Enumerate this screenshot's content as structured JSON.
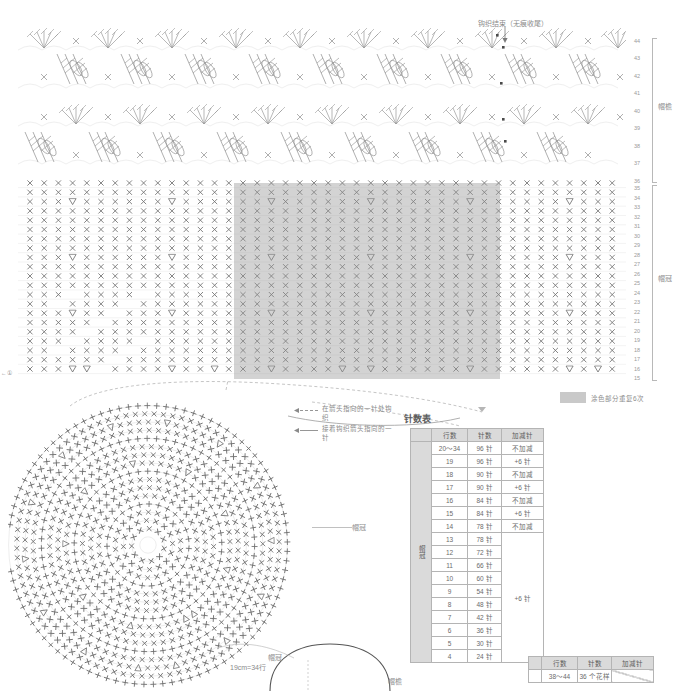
{
  "top_title": "",
  "annotations": {
    "finish": "钩织结束（无痕收尾）",
    "note_dashed": "在箭头指向的一针处钩织",
    "note_solid": "接着钩织箭头指向的一针",
    "legend_text": "涂色部分重复6次",
    "brim_label": "帽檐",
    "crown_label": "帽冠",
    "circle_crown_label": "帽冠",
    "hat_crown_label": "帽冠",
    "hat_brim_label": "帽檐",
    "hat_gauge": "19cm=34行",
    "start_mark": "←①"
  },
  "row_rails": {
    "brim": [
      "44",
      "43",
      "42",
      "41",
      "40",
      "39",
      "38",
      "37",
      "36"
    ],
    "crown": [
      "35",
      "34",
      "33",
      "32",
      "31",
      "30",
      "29",
      "28",
      "27",
      "26",
      "25",
      "24",
      "23",
      "22",
      "21",
      "20",
      "19",
      "18",
      "17",
      "16",
      "15"
    ]
  },
  "table_main": {
    "title": "针数表",
    "headers": [
      "",
      "行数",
      "针数",
      "加减针"
    ],
    "section_label": "帽冠",
    "rows": [
      {
        "row": "20～34",
        "stitches": "96 针",
        "change": "不加减"
      },
      {
        "row": "19",
        "stitches": "96 针",
        "change": "+6 针"
      },
      {
        "row": "18",
        "stitches": "90 针",
        "change": "不加减"
      },
      {
        "row": "17",
        "stitches": "90 针",
        "change": "+6 针"
      },
      {
        "row": "16",
        "stitches": "84 针",
        "change": "不加减"
      },
      {
        "row": "15",
        "stitches": "84 针",
        "change": "+6 针"
      },
      {
        "row": "14",
        "stitches": "78 针",
        "change": "不加减"
      },
      {
        "row": "13",
        "stitches": "78 针",
        "change": ""
      },
      {
        "row": "12",
        "stitches": "72 针",
        "change": ""
      },
      {
        "row": "11",
        "stitches": "66 针",
        "change": ""
      },
      {
        "row": "10",
        "stitches": "60 针",
        "change": ""
      },
      {
        "row": "9",
        "stitches": "54 针",
        "change": ""
      },
      {
        "row": "8",
        "stitches": "48 针",
        "change": ""
      },
      {
        "row": "7",
        "stitches": "42 针",
        "change": "+6 针"
      },
      {
        "row": "6",
        "stitches": "36 针",
        "change": ""
      },
      {
        "row": "5",
        "stitches": "30 针",
        "change": ""
      },
      {
        "row": "4",
        "stitches": "24 针",
        "change": ""
      }
    ],
    "merged_change_label": "+6 针"
  },
  "table_brim": {
    "headers": [
      "",
      "行数",
      "针数",
      "加减针"
    ],
    "rows": [
      {
        "row": "38～44",
        "stitches": "36 个花样",
        "change": ""
      }
    ]
  },
  "chart_data": {
    "type": "table",
    "title": "针数表",
    "columns": [
      "行数",
      "针数",
      "加减针"
    ],
    "categories": [
      "20～34",
      "19",
      "18",
      "17",
      "16",
      "15",
      "14",
      "13",
      "12",
      "11",
      "10",
      "9",
      "8",
      "7",
      "6",
      "5",
      "4"
    ],
    "values": [
      96,
      96,
      90,
      90,
      84,
      84,
      78,
      78,
      72,
      66,
      60,
      54,
      48,
      42,
      36,
      30,
      24
    ],
    "xlabel": "行数",
    "ylabel": "针数",
    "ylim": [
      0,
      100
    ],
    "annotations": [
      "不加减 = no increase/decrease",
      "+6 针 = increase 6 stitches",
      "38～44 行: 36 个花样"
    ],
    "legend": [
      "涂色部分重复6次"
    ]
  },
  "colors": {
    "shade": "#969696",
    "ink": "#8a8a8a",
    "table_header": "#dadada",
    "border": "#b4b4b4"
  }
}
